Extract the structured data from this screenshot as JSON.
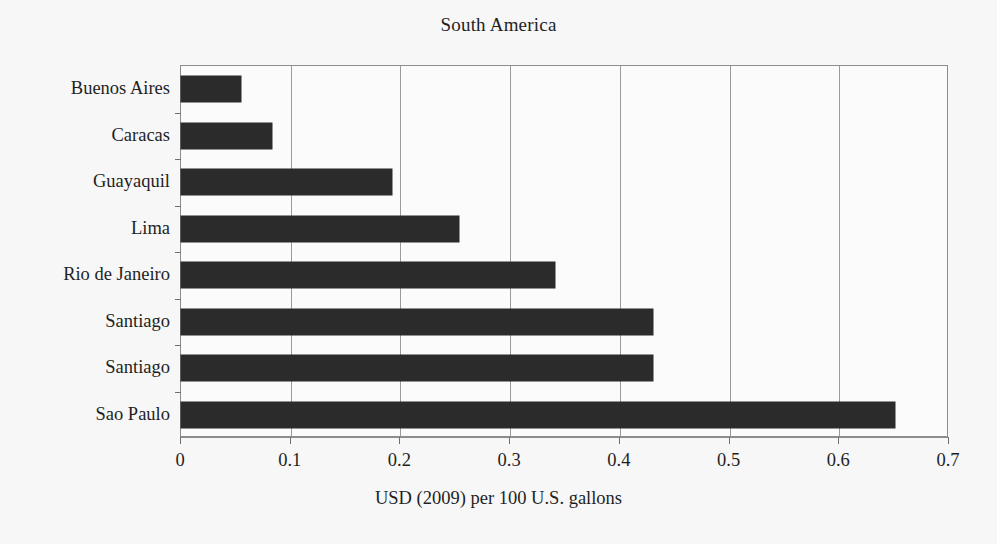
{
  "chart_data": {
    "type": "bar",
    "orientation": "horizontal",
    "title": "South America",
    "xlabel": "USD (2009) per 100 U.S. gallons",
    "ylabel": "",
    "categories": [
      "Buenos Aires",
      "Caracas",
      "Guayaquil",
      "Lima",
      "Rio de Janeiro",
      "Santiago",
      "Santiago",
      "Sao Paulo"
    ],
    "values": [
      0.055,
      0.083,
      0.192,
      0.253,
      0.341,
      0.43,
      0.43,
      0.651
    ],
    "xlim": [
      0,
      0.7
    ],
    "xticks": [
      0,
      0.1,
      0.2,
      0.3,
      0.4,
      0.5,
      0.6,
      0.7
    ],
    "xtick_labels": [
      "0",
      "0.1",
      "0.2",
      "0.3",
      "0.4",
      "0.5",
      "0.6",
      "0.7"
    ],
    "grid": "vertical",
    "legend": "none",
    "bar_color": "#2b2b2b",
    "grid_color": "#9a9a9a",
    "axis_color": "#8d8d8d",
    "background_color": "#f7f7f7"
  }
}
